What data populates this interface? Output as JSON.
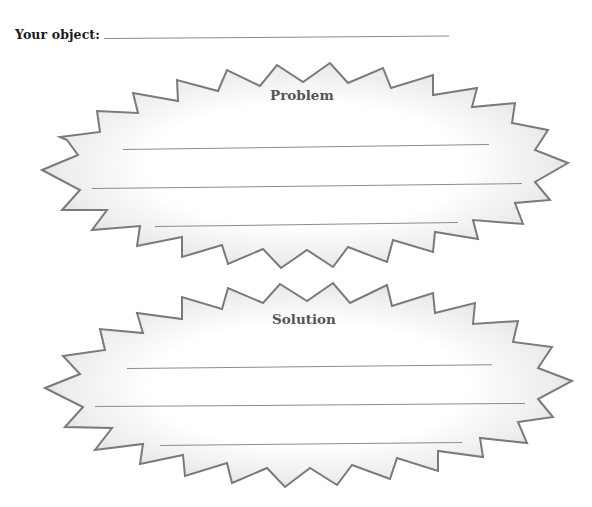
{
  "header": {
    "object_label": "Your object:",
    "object_value": ""
  },
  "sections": [
    {
      "id": "problem",
      "title": "Problem",
      "lines": [
        "",
        "",
        ""
      ]
    },
    {
      "id": "solution",
      "title": "Solution",
      "lines": [
        "",
        "",
        ""
      ]
    }
  ],
  "colors": {
    "stroke": "#7a7a7a",
    "fill_edge": "#d9d9d9",
    "fill_center": "#ffffff",
    "title_text": "#555555",
    "label_text": "#1a1a1a",
    "rule_line": "#8c8c8c"
  },
  "icons": {
    "starburst_shape": "starburst-icon"
  }
}
